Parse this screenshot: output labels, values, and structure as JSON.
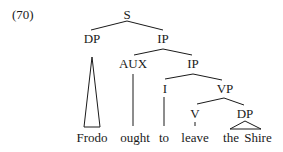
{
  "example_number": "(70)",
  "nodes": {
    "s": "S",
    "dp": "DP",
    "ip1": "IP",
    "aux": "AUX",
    "ip2": "IP",
    "i": "I",
    "vp": "VP",
    "v": "V",
    "dp2": "DP"
  },
  "leaves": {
    "frodo": "Frodo",
    "ought": "ought",
    "to": "to",
    "leave": "leave",
    "the": "the",
    "shire": "Shire"
  },
  "colors": {
    "ink": "#1a1a1a"
  }
}
